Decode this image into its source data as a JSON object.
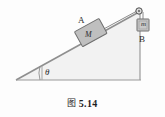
{
  "figure": {
    "caption_marker": "图",
    "caption_number": "5.14",
    "incline": {
      "angle_label": "θ",
      "surface_color": "#9a9a9a",
      "fill_color": "#f0f0f0"
    },
    "block_on_incline": {
      "outer_label": "A",
      "inner_label": "M",
      "fill_color": "#bfbfbf",
      "border_color": "#6e6e6e"
    },
    "hanging_mass": {
      "outer_label": "B",
      "inner_label": "m",
      "fill_color": "#c9c9c9",
      "border_color": "#6e6e6e"
    },
    "pulley": {
      "name": "pulley",
      "fill_color": "#d8d8d8",
      "border_color": "#5a5a5a"
    },
    "string_color": "#7a7a7a",
    "outline_color": "#8a8a8a"
  }
}
